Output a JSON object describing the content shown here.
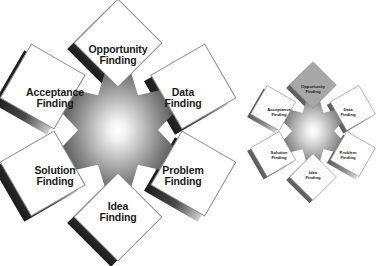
{
  "figure": {
    "background_color": "#ffffff",
    "star_points": 6,
    "star_gradient": {
      "center_color": "#ffffff",
      "mid_color": "#8a8a8a",
      "edge_color": "#1f1f1f"
    },
    "card_fill": "#ffffff",
    "card_border": "#8c8c8c",
    "card_shadow": "#2b2b2b",
    "highlight_fill": "#a8a8a8",
    "label_color": "#1a1a1a"
  },
  "main_diagram": {
    "name": "creative-problem-solving-star",
    "center": {
      "x": 118,
      "y": 130
    },
    "nodes": [
      {
        "id": "opportunity-finding",
        "line1": "Opportunity",
        "line2": "Finding",
        "angle_deg": 90,
        "rotation_deg": 45,
        "highlighted": false,
        "label_x": 118,
        "label_y": 55
      },
      {
        "id": "data-finding",
        "line1": "Data",
        "line2": "Finding",
        "angle_deg": 30,
        "rotation_deg": 30,
        "highlighted": false,
        "label_x": 183,
        "label_y": 98
      },
      {
        "id": "problem-finding",
        "line1": "Problem",
        "line2": "Finding",
        "angle_deg": -30,
        "rotation_deg": -30,
        "highlighted": false,
        "label_x": 183,
        "label_y": 176
      },
      {
        "id": "idea-finding",
        "line1": "Idea",
        "line2": "Finding",
        "angle_deg": -90,
        "rotation_deg": 45,
        "highlighted": false,
        "label_x": 118,
        "label_y": 212
      },
      {
        "id": "solution-finding",
        "line1": "Solution",
        "line2": "Finding",
        "angle_deg": -150,
        "rotation_deg": 30,
        "highlighted": false,
        "label_x": 55,
        "label_y": 176
      },
      {
        "id": "acceptance-finding",
        "line1": "Acceptance",
        "line2": "Finding",
        "angle_deg": 150,
        "rotation_deg": -30,
        "highlighted": false,
        "label_x": 55,
        "label_y": 98
      }
    ]
  },
  "small_diagram": {
    "name": "creative-problem-solving-star-thumbnail",
    "center": {
      "x": 313,
      "y": 131
    },
    "nodes": [
      {
        "id": "opportunity-finding",
        "line1": "Opportunity",
        "line2": "Finding",
        "angle_deg": 90,
        "rotation_deg": 45,
        "highlighted": true,
        "label_x": 313,
        "label_y": 90
      },
      {
        "id": "data-finding",
        "line1": "Data",
        "line2": "Finding",
        "angle_deg": 30,
        "rotation_deg": 30,
        "highlighted": false,
        "label_x": 348,
        "label_y": 113
      },
      {
        "id": "problem-finding",
        "line1": "Problem",
        "line2": "Finding",
        "angle_deg": -30,
        "rotation_deg": -30,
        "highlighted": false,
        "label_x": 348,
        "label_y": 156
      },
      {
        "id": "idea-finding",
        "line1": "Idea",
        "line2": "Finding",
        "angle_deg": -90,
        "rotation_deg": 45,
        "highlighted": false,
        "label_x": 313,
        "label_y": 176
      },
      {
        "id": "solution-finding",
        "line1": "Solution",
        "line2": "Finding",
        "angle_deg": -150,
        "rotation_deg": 30,
        "highlighted": false,
        "label_x": 279,
        "label_y": 156
      },
      {
        "id": "acceptance-finding",
        "line1": "Acceptance",
        "line2": "Finding",
        "angle_deg": 150,
        "rotation_deg": -30,
        "highlighted": false,
        "label_x": 279,
        "label_y": 113
      }
    ]
  }
}
